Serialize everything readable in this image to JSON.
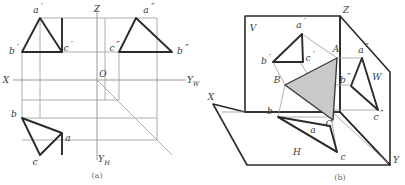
{
  "figure": {
    "captions": {
      "left": "(a)",
      "right": "(b)"
    },
    "colors": {
      "thin_line": "#9a9a9a",
      "thick_line": "#2b2b2b",
      "axis_line": "#8d8d8d",
      "shade_fill": "#c9c9c9",
      "shade_stroke": "#3a3a3a",
      "label_text": "#3a3a3a",
      "caption_text": "#6b6b6b",
      "background": "#ffffff"
    }
  },
  "left_view": {
    "name": "orthographic-projection-three-view",
    "axes": [
      {
        "id": "axis-x",
        "label": "X"
      },
      {
        "id": "axis-z",
        "label": "Z"
      },
      {
        "id": "axis-yw",
        "label": "Y",
        "subscript": "W"
      },
      {
        "id": "axis-yh",
        "label": "Y",
        "subscript": "H"
      },
      {
        "id": "origin",
        "label": "O"
      }
    ],
    "points": [
      {
        "id": "a-prime",
        "label": "a",
        "prime": "′",
        "view": "frontal"
      },
      {
        "id": "b-prime",
        "label": "b",
        "prime": "′",
        "view": "frontal"
      },
      {
        "id": "c-prime",
        "label": "c",
        "prime": "′",
        "view": "frontal"
      },
      {
        "id": "a-double-prime",
        "label": "a",
        "prime": "″",
        "view": "profile"
      },
      {
        "id": "b-double-prime",
        "label": "b",
        "prime": "″",
        "view": "profile"
      },
      {
        "id": "c-double-prime",
        "label": "c",
        "prime": "″",
        "view": "profile"
      },
      {
        "id": "a-plain",
        "label": "a",
        "prime": "",
        "view": "horizontal"
      },
      {
        "id": "b-plain",
        "label": "b",
        "prime": "",
        "view": "horizontal"
      },
      {
        "id": "c-plain",
        "label": "c",
        "prime": "",
        "view": "horizontal"
      }
    ]
  },
  "right_view": {
    "name": "pictorial-axonometric-view",
    "axes": [
      {
        "id": "axis-x",
        "label": "X"
      },
      {
        "id": "axis-z",
        "label": "Z"
      },
      {
        "id": "axis-y",
        "label": "Y"
      }
    ],
    "planes": [
      {
        "id": "plane-v",
        "label": "V"
      },
      {
        "id": "plane-h",
        "label": "H"
      },
      {
        "id": "plane-w",
        "label": "W"
      }
    ],
    "points": [
      {
        "id": "A",
        "label": "A"
      },
      {
        "id": "B",
        "label": "B"
      },
      {
        "id": "C",
        "label": "C"
      },
      {
        "id": "a-prime",
        "label": "a",
        "prime": "′"
      },
      {
        "id": "b-prime",
        "label": "b",
        "prime": "′"
      },
      {
        "id": "c-prime",
        "label": "c",
        "prime": "′"
      },
      {
        "id": "a-double-prime",
        "label": "a",
        "prime": "″"
      },
      {
        "id": "b-double-prime",
        "label": "b",
        "prime": "″"
      },
      {
        "id": "c-double-prime",
        "label": "c",
        "prime": "″"
      },
      {
        "id": "a-plain",
        "label": "a",
        "prime": ""
      },
      {
        "id": "b-plain",
        "label": "b",
        "prime": ""
      },
      {
        "id": "c-plain",
        "label": "c",
        "prime": ""
      }
    ]
  }
}
